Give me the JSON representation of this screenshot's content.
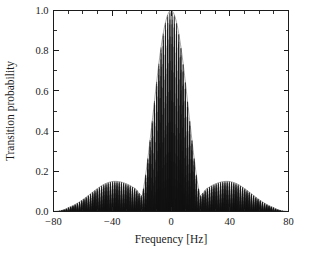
{
  "chart_data": {
    "type": "line",
    "title": "",
    "subtitle": "",
    "xlabel": "Frequency [Hz]",
    "ylabel": "Transition probability",
    "xlim": [
      -80,
      80
    ],
    "ylim": [
      0.0,
      1.0
    ],
    "grid": false,
    "legend": null,
    "legend_position": "none",
    "x_ticks": [
      -80,
      -40,
      0,
      40,
      80
    ],
    "x_tick_labels": [
      "-80",
      "-40",
      "0",
      "40",
      "80"
    ],
    "x_minor_tick_step": 10,
    "y_ticks": [
      0.0,
      0.2,
      0.4,
      0.6,
      0.8,
      1.0
    ],
    "y_tick_labels": [
      "0.0",
      "0.2",
      "0.4",
      "0.6",
      "0.8",
      "1.0"
    ],
    "y_minor_tick_step": 0.1,
    "series": [
      {
        "name": "Transition probability",
        "color": "#141414",
        "model": "ramsey_fringes",
        "fringe_period_hz": 1.5,
        "envelope_main_lobe_half_width_hz": 24,
        "envelope_peak": 1.0,
        "envelope_peak_x": 0,
        "side_lobe_peak": 0.15,
        "side_lobe_peak_x": 38,
        "annotations": []
      }
    ],
    "envelope_points": {
      "x": [
        -80,
        -75,
        -70,
        -65,
        -60,
        -55,
        -50,
        -45,
        -40,
        -38,
        -35,
        -30,
        -25,
        -20,
        -15,
        -10,
        -5,
        0,
        5,
        10,
        15,
        20,
        25,
        30,
        35,
        38,
        40,
        45,
        50,
        55,
        60,
        65,
        70,
        75,
        80
      ],
      "y": [
        0.005,
        0.012,
        0.022,
        0.036,
        0.055,
        0.078,
        0.102,
        0.128,
        0.147,
        0.151,
        0.148,
        0.131,
        0.19,
        0.37,
        0.59,
        0.79,
        0.95,
        1.0,
        0.95,
        0.79,
        0.59,
        0.37,
        0.19,
        0.131,
        0.148,
        0.151,
        0.147,
        0.128,
        0.102,
        0.078,
        0.055,
        0.036,
        0.022,
        0.012,
        0.005
      ]
    }
  },
  "figure": {
    "background_color": "#ffffff",
    "axis_color": "#1c1c1c",
    "data_color": "#141414"
  }
}
